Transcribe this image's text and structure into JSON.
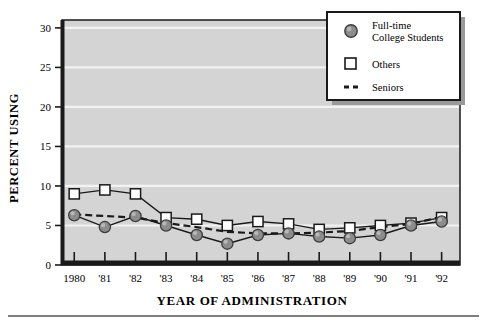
{
  "chart_data": {
    "type": "line",
    "title": "",
    "xlabel": "YEAR OF ADMINISTRATION",
    "ylabel": "PERCENT USING",
    "x": [
      1980,
      1981,
      1982,
      1983,
      1984,
      1985,
      1986,
      1987,
      1988,
      1989,
      1990,
      1991,
      1992
    ],
    "categories": [
      "1980",
      "'81",
      "'82",
      "'83",
      "'84",
      "'85",
      "'86",
      "'87",
      "'88",
      "'89",
      "'90",
      "'91",
      "'92"
    ],
    "xtick_labels": [
      "1980",
      "'81",
      "'82",
      "'83",
      "'84",
      "'85",
      "'86",
      "'87",
      "'88",
      "'89",
      "'90",
      "'91",
      "'92"
    ],
    "ytick_labels": [
      "0",
      "5",
      "10",
      "15",
      "20",
      "25",
      "30"
    ],
    "yticks": [
      0,
      5,
      10,
      15,
      20,
      25,
      30
    ],
    "ylim": [
      0,
      31
    ],
    "xlim": [
      1979.6,
      1992.6
    ],
    "grid": "horizontal",
    "legend_position": "top-right",
    "plot_background": "#d4d4d4",
    "gridline_color": "#f2f2f2",
    "series": [
      {
        "name": "Full-time College Students",
        "marker": "filled-circle",
        "line_style": "solid",
        "color": "#8c8c8c",
        "values": [
          6.3,
          4.8,
          6.2,
          5.0,
          3.8,
          2.7,
          3.8,
          4.0,
          3.6,
          3.4,
          3.8,
          5.0,
          5.5
        ]
      },
      {
        "name": "Others",
        "marker": "open-square",
        "line_style": "solid",
        "color": "#ffffff",
        "values": [
          9.0,
          9.5,
          9.0,
          6.0,
          5.8,
          5.0,
          5.5,
          5.2,
          4.5,
          4.7,
          5.0,
          5.3,
          6.0
        ]
      },
      {
        "name": "Seniors",
        "marker": "none",
        "line_style": "dashed",
        "color": "#1a1a1a",
        "values": [
          6.4,
          6.2,
          6.0,
          5.3,
          4.8,
          4.2,
          4.0,
          4.0,
          4.1,
          4.3,
          4.8,
          5.2,
          6.1
        ]
      }
    ]
  },
  "legend": {
    "items": [
      {
        "label_line1": "Full-time",
        "label_line2": "College Students",
        "marker": "filled-circle"
      },
      {
        "label_line1": "Others",
        "label_line2": "",
        "marker": "open-square"
      },
      {
        "label_line1": "Seniors",
        "label_line2": "",
        "marker": "dashed-line"
      }
    ]
  },
  "colors": {
    "plot_bg": "#d4d4d4",
    "grid": "#f2f2f2",
    "frame": "#1a1a1a",
    "circle_fill": "#8c8c8c",
    "circle_stroke": "#3d3d3d",
    "square_fill": "#ffffff",
    "square_stroke": "#1a1a1a",
    "legend_bg": "#ffffff",
    "legend_shadow": "#9a9a9a",
    "rule": "#555555"
  }
}
